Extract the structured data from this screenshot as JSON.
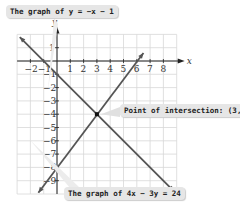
{
  "callouts": {
    "top": "The graph of y = −x − 1",
    "right": "Point of intersection: (3, −4)",
    "bottom": "The graph of 4x − 3y = 24"
  },
  "axes": {
    "x_label": "x",
    "y_label": "y"
  },
  "chart_data": {
    "type": "line",
    "title": "",
    "xlabel": "x",
    "ylabel": "y",
    "xlim": [
      -3,
      9
    ],
    "ylim": [
      -10,
      2
    ],
    "grid": true,
    "x_ticks": [
      -2,
      -1,
      1,
      2,
      3,
      4,
      5,
      6,
      7,
      8
    ],
    "y_ticks": [
      1,
      -1,
      -2,
      -3,
      -4,
      -5,
      -6,
      -7,
      -8,
      -9
    ],
    "series": [
      {
        "name": "y = -x - 1",
        "x": [
          -2.8,
          8.8
        ],
        "y": [
          1.8,
          -9.8
        ]
      },
      {
        "name": "4x - 3y = 24",
        "x": [
          -1.4,
          6.5
        ],
        "y": [
          -9.9,
          0.6
        ]
      }
    ],
    "points": [
      {
        "label": "Point of intersection",
        "x": 3,
        "y": -4
      }
    ]
  }
}
